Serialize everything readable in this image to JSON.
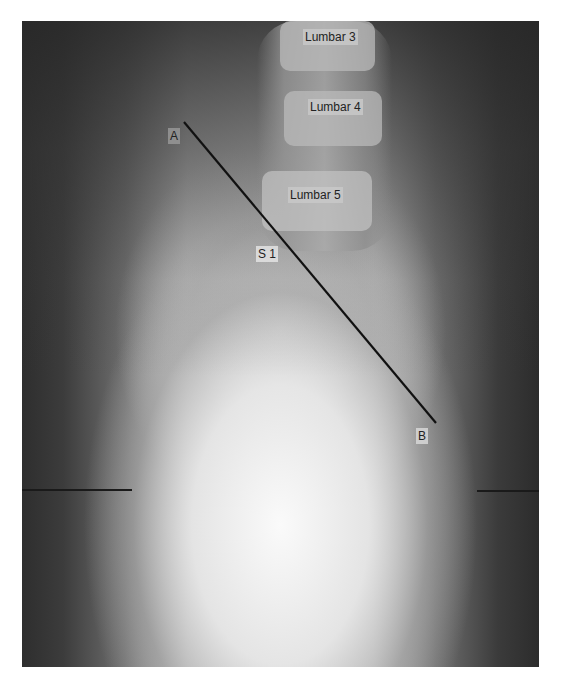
{
  "image": {
    "type": "lateral lumbar spine radiograph",
    "line_color": "#111111"
  },
  "labels": {
    "lumbar3": "Lumbar 3",
    "lumbar4": "Lumbar 4",
    "lumbar5": "Lumbar 5",
    "s1": "S 1",
    "point_a": "A",
    "point_b": "B"
  },
  "measurement_line": {
    "from": "A",
    "to": "B"
  }
}
